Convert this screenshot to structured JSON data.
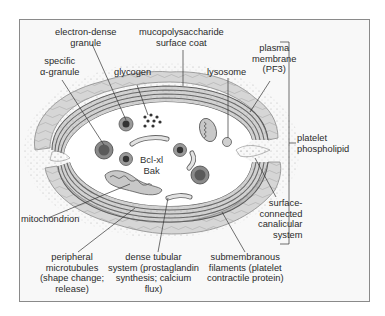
{
  "diagram": {
    "labels": {
      "electron_dense_granule": [
        "electron-dense",
        "granule"
      ],
      "mucopolysaccharide": [
        "mucopolysaccharide",
        "surface coat"
      ],
      "specific_alpha_granule": [
        "specific",
        "α-granule"
      ],
      "glycogen": [
        "glycogen"
      ],
      "lysosome": [
        "lysosome"
      ],
      "plasma_membrane": [
        "plasma",
        "membrane",
        "(PF3)"
      ],
      "platelet_phospholipid": [
        "platelet",
        "phospholipid"
      ],
      "mitochondrion": [
        "mitochondrion"
      ],
      "surface_connected": [
        "surface-",
        "connected",
        "canalicular",
        "system"
      ],
      "peripheral_microtubules": [
        "peripheral",
        "microtubules",
        "(shape change;",
        "release)"
      ],
      "dense_tubular": [
        "dense tubular",
        "system (prostaglandin",
        "synthesis; calcium",
        "flux)"
      ],
      "submembranous": [
        "submembranous",
        "filaments (platelet",
        "contractile protein)"
      ],
      "center_proteins": [
        "Bcl-xl",
        "Bak"
      ]
    },
    "colors": {
      "frame_bg": "#f8f8f8",
      "frame_border": "#8a8a8a",
      "coat_fill": "#d9d9d9",
      "microtubule_band": "#6e6e6e",
      "cytoplasm": "#ffffff",
      "granule_dark": "#555555",
      "leader_line": "#333333"
    }
  }
}
